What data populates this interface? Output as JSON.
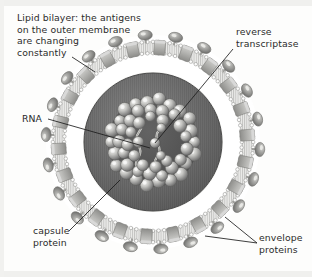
{
  "diagram": {
    "background_color": "#fdfdfc",
    "labels": {
      "lipid_bilayer": "Lipid bilayer: the antigens\non the outer membrane\nare changing\nconstantly",
      "reverse_transcriptase": "reverse\ntranscriptase",
      "rna": "RNA",
      "capsule_protein": "capsule\nprotein",
      "envelope_proteins": "envelope\nproteins"
    },
    "colors": {
      "text": "#2b2b2b",
      "leader_line": "#1a1a1a",
      "matrix_fill": "#6f6f6f",
      "matrix_edge": "#4a4a4a",
      "membrane_fill": "#e8e8e6",
      "membrane_bead": "#ffffff",
      "capsule_protein_fill": "#b9b9b6",
      "envelope_protein_fill": "#9a9a98",
      "capsid_sphere_light": "#e6e6e4",
      "capsid_sphere_dark": "#707070",
      "rna_strand": "#d8d8d4",
      "core_fill": "#555555"
    },
    "geometry": {
      "center_x": 153,
      "center_y": 142,
      "membrane_outer_radius": 101,
      "membrane_inner_radius": 88,
      "matrix_radius": 69,
      "capsid_radius": 45,
      "envelope_protein_count": 22,
      "capsule_protein_count": 22,
      "capsid_sphere_count": 54
    }
  }
}
